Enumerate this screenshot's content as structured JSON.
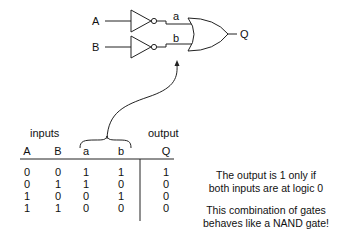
{
  "circuit": {
    "input_labels": [
      "A",
      "B"
    ],
    "intermediate_labels": [
      "a",
      "b"
    ],
    "output_label": "Q",
    "gates": [
      "NOT",
      "NOT",
      "OR"
    ]
  },
  "table": {
    "group_headers": {
      "inputs": "inputs",
      "output": "output"
    },
    "columns": [
      "A",
      "B",
      "a",
      "b",
      "Q"
    ],
    "rows": [
      [
        "0",
        "0",
        "1",
        "1",
        "1"
      ],
      [
        "0",
        "1",
        "1",
        "0",
        "0"
      ],
      [
        "1",
        "0",
        "0",
        "1",
        "0"
      ],
      [
        "1",
        "1",
        "0",
        "0",
        "0"
      ]
    ]
  },
  "notes": {
    "line1": "The output is 1 only if",
    "line2": "both inputs are at logic 0",
    "line3": "This combination of gates",
    "line4": "behaves like a NAND gate!"
  }
}
